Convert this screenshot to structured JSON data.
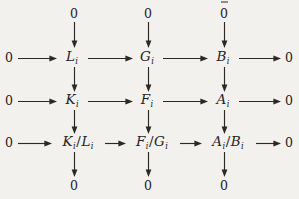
{
  "diagram": {
    "type": "commutative-diagram",
    "background_color": "#f2f1ee",
    "ink_color": "#2c2824",
    "subscript": "i",
    "rows": [
      {
        "id": "row-top-zeros",
        "nodes": [
          {
            "id": "n-top-0-col1",
            "label": "0",
            "kind": "zero",
            "x": 74,
            "y": 14
          },
          {
            "id": "n-top-0-col2",
            "label": "0",
            "kind": "zero",
            "x": 148,
            "y": 14
          },
          {
            "id": "n-top-0-col3",
            "label": "0",
            "kind": "zero",
            "x": 224,
            "y": 14
          }
        ]
      },
      {
        "id": "row-1",
        "nodes": [
          {
            "id": "n-r1-zero-left",
            "label": "0",
            "kind": "zero",
            "x": 9,
            "y": 58
          },
          {
            "id": "n-r1-L",
            "base": "L",
            "sub": "i",
            "kind": "object",
            "x": 72,
            "y": 58
          },
          {
            "id": "n-r1-G",
            "base": "G",
            "sub": "i",
            "kind": "object",
            "x": 147,
            "y": 58
          },
          {
            "id": "n-r1-B",
            "base": "B",
            "sub": "i",
            "kind": "object",
            "x": 223,
            "y": 58
          },
          {
            "id": "n-r1-zero-right",
            "label": "0",
            "kind": "zero",
            "x": 289,
            "y": 58
          }
        ]
      },
      {
        "id": "row-2",
        "nodes": [
          {
            "id": "n-r2-zero-left",
            "label": "0",
            "kind": "zero",
            "x": 9,
            "y": 101
          },
          {
            "id": "n-r2-K",
            "base": "K",
            "sub": "i",
            "kind": "object",
            "x": 72,
            "y": 101
          },
          {
            "id": "n-r2-F",
            "base": "F",
            "sub": "i",
            "kind": "object",
            "x": 147,
            "y": 101
          },
          {
            "id": "n-r2-A",
            "base": "A",
            "sub": "i",
            "kind": "object",
            "x": 223,
            "y": 101
          },
          {
            "id": "n-r2-zero-right",
            "label": "0",
            "kind": "zero",
            "x": 289,
            "y": 101
          }
        ]
      },
      {
        "id": "row-3",
        "nodes": [
          {
            "id": "n-r3-zero-left",
            "label": "0",
            "kind": "zero",
            "x": 9,
            "y": 143
          },
          {
            "id": "n-r3-KL",
            "base": "K",
            "sub": "i",
            "base2": "L",
            "sub2": "i",
            "kind": "quotient",
            "x": 78,
            "y": 143
          },
          {
            "id": "n-r3-FG",
            "base": "F",
            "sub": "i",
            "base2": "G",
            "sub2": "i",
            "kind": "quotient",
            "x": 152,
            "y": 143
          },
          {
            "id": "n-r3-AB",
            "base": "A",
            "sub": "i",
            "base2": "B",
            "sub2": "i",
            "kind": "quotient",
            "x": 228,
            "y": 143
          },
          {
            "id": "n-r3-zero-right",
            "label": "0",
            "kind": "zero",
            "x": 289,
            "y": 143
          }
        ]
      },
      {
        "id": "row-bottom-zeros",
        "nodes": [
          {
            "id": "n-bot-0-col1",
            "label": "0",
            "kind": "zero",
            "x": 74,
            "y": 186
          },
          {
            "id": "n-bot-0-col2",
            "label": "0",
            "kind": "zero",
            "x": 148,
            "y": 186
          },
          {
            "id": "n-bot-0-col3",
            "label": "0",
            "kind": "zero",
            "x": 224,
            "y": 186
          }
        ]
      }
    ],
    "horizontal_arrows": [
      {
        "id": "h-r1-a",
        "x1": 18,
        "y": 58,
        "x2": 57
      },
      {
        "id": "h-r1-b",
        "x1": 88,
        "y": 58,
        "x2": 133
      },
      {
        "id": "h-r1-c",
        "x1": 163,
        "y": 58,
        "x2": 208
      },
      {
        "id": "h-r1-d",
        "x1": 239,
        "y": 58,
        "x2": 281
      },
      {
        "id": "h-r2-a",
        "x1": 18,
        "y": 101,
        "x2": 57
      },
      {
        "id": "h-r2-b",
        "x1": 88,
        "y": 101,
        "x2": 133
      },
      {
        "id": "h-r2-c",
        "x1": 163,
        "y": 101,
        "x2": 208
      },
      {
        "id": "h-r2-d",
        "x1": 239,
        "y": 101,
        "x2": 281
      },
      {
        "id": "h-r3-a",
        "x1": 18,
        "y": 143,
        "x2": 52
      },
      {
        "id": "h-r3-b",
        "x1": 105,
        "y": 143,
        "x2": 126
      },
      {
        "id": "h-r3-c",
        "x1": 180,
        "y": 143,
        "x2": 202
      },
      {
        "id": "h-r3-d",
        "x1": 256,
        "y": 143,
        "x2": 281
      }
    ],
    "vertical_arrows": [
      {
        "id": "v-c1-top",
        "x": 74,
        "y1": 22,
        "y2": 48
      },
      {
        "id": "v-c2-top",
        "x": 148,
        "y1": 22,
        "y2": 48
      },
      {
        "id": "v-c3-top",
        "x": 224,
        "y1": 22,
        "y2": 48
      },
      {
        "id": "v-c1-m1",
        "x": 74,
        "y1": 67,
        "y2": 92
      },
      {
        "id": "v-c2-m1",
        "x": 148,
        "y1": 67,
        "y2": 92
      },
      {
        "id": "v-c3-m1",
        "x": 224,
        "y1": 67,
        "y2": 92
      },
      {
        "id": "v-c1-m2",
        "x": 74,
        "y1": 110,
        "y2": 134
      },
      {
        "id": "v-c2-m2",
        "x": 148,
        "y1": 110,
        "y2": 134
      },
      {
        "id": "v-c3-m2",
        "x": 224,
        "y1": 110,
        "y2": 134
      },
      {
        "id": "v-c1-bot",
        "x": 74,
        "y1": 152,
        "y2": 177
      },
      {
        "id": "v-c2-bot",
        "x": 148,
        "y1": 152,
        "y2": 177
      },
      {
        "id": "v-c3-bot",
        "x": 224,
        "y1": 152,
        "y2": 177
      }
    ],
    "artifacts": [
      {
        "id": "scan-speck-top",
        "x": 221,
        "y": 1,
        "w": 7,
        "h": 2
      }
    ]
  }
}
